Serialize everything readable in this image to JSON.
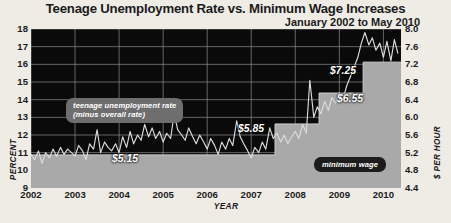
{
  "header": {
    "title": "Teenage Unemployment Rate vs. Minimum Wage Increases",
    "subtitle": "January 2002 to May 2010"
  },
  "colors": {
    "background": "#efece6",
    "plot_background": "#0a0a0a",
    "grid": "#8d8d8d",
    "unemployment_line": "#d8d8d8",
    "wage_area": "#a9a9a9",
    "text": "#1b1b1b",
    "callout_teen_bg": "#6e6e6e",
    "callout_wage_bg": "#1c1c1c"
  },
  "annotations": {
    "teen_callout": "teenage unemployment rate\n(minus overall rate)",
    "wage_callout": "minimum wage",
    "wage_labels": [
      {
        "text": "$5.15",
        "x": 112,
        "y": 153
      },
      {
        "text": "$5.85",
        "x": 238,
        "y": 123
      },
      {
        "text": "$6.55",
        "x": 337,
        "y": 93
      },
      {
        "text": "$7.25",
        "x": 330,
        "y": 65
      }
    ]
  },
  "chart_data": {
    "type": "line",
    "title": "Teenage Unemployment Rate vs. Minimum Wage Increases",
    "subtitle": "January 2002 to May 2010",
    "xlabel": "YEAR",
    "ylabel": "PERCENT",
    "ylabel_right": "$ PER HOUR",
    "grid": true,
    "legend": "inline-callouts",
    "xlim": [
      2002.0,
      2010.4
    ],
    "ylim": [
      9,
      18
    ],
    "ylim_right": [
      4.4,
      8.0
    ],
    "xticks": [
      "2002",
      "2003",
      "2004",
      "2005",
      "2006",
      "2007",
      "2008",
      "2009",
      "2010"
    ],
    "yticks_left": [
      "9",
      "10",
      "11",
      "12",
      "13",
      "14",
      "15",
      "16",
      "17",
      "18"
    ],
    "yticks_right": [
      "4.4",
      "4.8",
      "5.2",
      "5.6",
      "6.0",
      "6.4",
      "6.8",
      "7.2",
      "7.6",
      "8.0"
    ],
    "series": [
      {
        "name": "teenage unemployment rate (minus overall rate)",
        "axis": "left",
        "unit": "percent",
        "style": "line",
        "x": [
          2002.0,
          2002.08,
          2002.17,
          2002.25,
          2002.33,
          2002.42,
          2002.5,
          2002.58,
          2002.67,
          2002.75,
          2002.83,
          2002.92,
          2003.0,
          2003.08,
          2003.17,
          2003.25,
          2003.33,
          2003.42,
          2003.5,
          2003.58,
          2003.67,
          2003.75,
          2003.83,
          2003.92,
          2004.0,
          2004.08,
          2004.17,
          2004.25,
          2004.33,
          2004.42,
          2004.5,
          2004.58,
          2004.67,
          2004.75,
          2004.83,
          2004.92,
          2005.0,
          2005.08,
          2005.17,
          2005.25,
          2005.33,
          2005.42,
          2005.5,
          2005.58,
          2005.67,
          2005.75,
          2005.83,
          2005.92,
          2006.0,
          2006.08,
          2006.17,
          2006.25,
          2006.33,
          2006.42,
          2006.5,
          2006.58,
          2006.67,
          2006.75,
          2006.83,
          2006.92,
          2007.0,
          2007.08,
          2007.17,
          2007.25,
          2007.33,
          2007.42,
          2007.5,
          2007.58,
          2007.67,
          2007.75,
          2007.83,
          2007.92,
          2008.0,
          2008.08,
          2008.17,
          2008.25,
          2008.33,
          2008.42,
          2008.5,
          2008.58,
          2008.67,
          2008.75,
          2008.83,
          2008.92,
          2009.0,
          2009.08,
          2009.17,
          2009.25,
          2009.33,
          2009.42,
          2009.5,
          2009.58,
          2009.67,
          2009.75,
          2009.83,
          2009.92,
          2010.0,
          2010.08,
          2010.17,
          2010.25,
          2010.33
        ],
        "y": [
          10.9,
          10.6,
          11.1,
          10.4,
          11.0,
          10.7,
          11.2,
          10.8,
          11.3,
          10.9,
          11.2,
          11.0,
          10.8,
          11.4,
          11.1,
          10.6,
          11.5,
          11.2,
          12.3,
          11.0,
          11.6,
          11.3,
          11.1,
          11.5,
          11.0,
          11.9,
          11.3,
          12.2,
          11.5,
          12.0,
          11.7,
          12.6,
          11.9,
          12.4,
          11.8,
          12.2,
          11.6,
          12.1,
          11.8,
          13.2,
          12.3,
          12.0,
          11.7,
          12.4,
          11.9,
          11.5,
          12.0,
          11.6,
          11.2,
          11.8,
          11.4,
          10.9,
          11.6,
          11.2,
          11.8,
          11.4,
          12.8,
          11.9,
          11.5,
          11.1,
          10.7,
          11.3,
          11.0,
          11.6,
          11.2,
          12.4,
          11.8,
          12.1,
          11.6,
          12.0,
          11.5,
          11.9,
          12.2,
          11.8,
          12.6,
          12.1,
          15.1,
          13.0,
          13.6,
          13.2,
          13.9,
          13.4,
          14.1,
          13.8,
          14.4,
          14.0,
          14.8,
          15.3,
          15.8,
          16.4,
          17.2,
          17.8,
          17.1,
          17.5,
          16.8,
          17.2,
          16.4,
          17.3,
          16.2,
          17.4,
          16.6
        ]
      },
      {
        "name": "minimum wage",
        "axis": "right",
        "unit": "$ per hour",
        "style": "step-area",
        "steps": [
          {
            "from": 2002.0,
            "to": 2007.54,
            "value": 5.15
          },
          {
            "from": 2007.54,
            "to": 2008.54,
            "value": 5.85
          },
          {
            "from": 2008.54,
            "to": 2009.54,
            "value": 6.55
          },
          {
            "from": 2009.54,
            "to": 2010.4,
            "value": 7.25
          }
        ]
      }
    ]
  }
}
